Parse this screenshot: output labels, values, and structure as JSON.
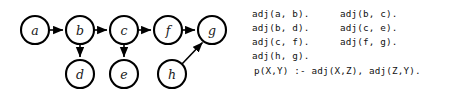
{
  "graph": {
    "nodes": [
      {
        "id": "a",
        "label": "a",
        "cx": 35,
        "cy": 30,
        "r": 14
      },
      {
        "id": "b",
        "label": "b",
        "cx": 80,
        "cy": 30,
        "r": 14
      },
      {
        "id": "c",
        "label": "c",
        "cx": 124,
        "cy": 30,
        "r": 14
      },
      {
        "id": "f",
        "label": "f",
        "cx": 168,
        "cy": 30,
        "r": 14
      },
      {
        "id": "g",
        "label": "g",
        "cx": 212,
        "cy": 30,
        "r": 14
      },
      {
        "id": "d",
        "label": "d",
        "cx": 80,
        "cy": 74,
        "r": 14
      },
      {
        "id": "e",
        "label": "e",
        "cx": 124,
        "cy": 74,
        "r": 14
      },
      {
        "id": "h",
        "label": "h",
        "cx": 172,
        "cy": 74,
        "r": 14
      }
    ],
    "edges": [
      {
        "from": "a",
        "to": "b",
        "kind": "horizontal"
      },
      {
        "from": "b",
        "to": "c",
        "kind": "horizontal"
      },
      {
        "from": "c",
        "to": "f",
        "kind": "horizontal"
      },
      {
        "from": "f",
        "to": "g",
        "kind": "horizontal"
      },
      {
        "from": "b",
        "to": "d",
        "kind": "vertical"
      },
      {
        "from": "c",
        "to": "e",
        "kind": "vertical"
      },
      {
        "from": "h",
        "to": "g",
        "kind": "diagonal"
      }
    ]
  },
  "code": {
    "lines": [
      {
        "col1": "adj(a, b).",
        "col2": "adj(b, c)."
      },
      {
        "col1": "adj(b, d).",
        "col2": "adj(c, e)."
      },
      {
        "col1": "adj(c, f).",
        "col2": "adj(f, g)."
      },
      {
        "col1": "adj(h, g).",
        "col2": ""
      }
    ],
    "rule": "p(X,Y) :- adj(X,Z), adj(Z,Y)."
  }
}
